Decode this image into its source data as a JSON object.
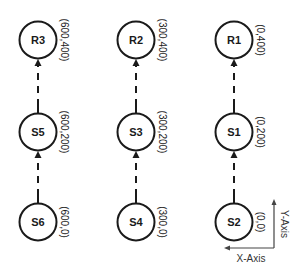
{
  "diagram": {
    "type": "node-grid-with-upward-edges",
    "colors": {
      "stroke": "#1a1a1a",
      "background": "#ffffff",
      "axis": "#444444"
    },
    "nodes": [
      {
        "id": "R3",
        "label": "R3",
        "coord": "(600,400)",
        "col": 0,
        "row": 0
      },
      {
        "id": "R2",
        "label": "R2",
        "coord": "(300,400)",
        "col": 1,
        "row": 0
      },
      {
        "id": "R1",
        "label": "R1",
        "coord": "(0,400)",
        "col": 2,
        "row": 0
      },
      {
        "id": "S5",
        "label": "S5",
        "coord": "(600,200)",
        "col": 0,
        "row": 1
      },
      {
        "id": "S3",
        "label": "S3",
        "coord": "(300,200)",
        "col": 1,
        "row": 1
      },
      {
        "id": "S1",
        "label": "S1",
        "coord": "(0,200)",
        "col": 2,
        "row": 1
      },
      {
        "id": "S6",
        "label": "S6",
        "coord": "(600,0)",
        "col": 0,
        "row": 2
      },
      {
        "id": "S4",
        "label": "S4",
        "coord": "(300,0)",
        "col": 1,
        "row": 2
      },
      {
        "id": "S2",
        "label": "S2",
        "coord": "(0,0)",
        "col": 2,
        "row": 2
      }
    ],
    "edges": [
      {
        "from": "S6",
        "to": "S5",
        "style": "dashed-arrow"
      },
      {
        "from": "S5",
        "to": "R3",
        "style": "dashed-arrow"
      },
      {
        "from": "S4",
        "to": "S3",
        "style": "dashed-arrow"
      },
      {
        "from": "S3",
        "to": "R2",
        "style": "dashed-arrow"
      },
      {
        "from": "S2",
        "to": "S1",
        "style": "dashed-arrow"
      },
      {
        "from": "S1",
        "to": "R1",
        "style": "dashed-arrow"
      }
    ],
    "axes": {
      "x_label": "X-Axis",
      "y_label": "Y-Axis",
      "x_direction": "left",
      "y_direction": "up"
    }
  }
}
